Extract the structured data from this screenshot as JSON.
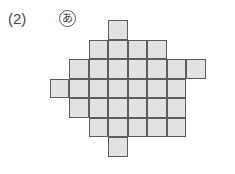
{
  "figure": {
    "label": "(2)",
    "marker": {
      "name": "circled-hiragana-a",
      "glyph": "あ"
    },
    "background_color": "#ffffff",
    "cell_fill_color": "#e2e2e2",
    "cell_stroke_color": "#5d5d5d",
    "label_color": "#4a4a4a"
  },
  "grid": {
    "origin_x": 30,
    "origin_y": 20,
    "cell_size": 19.5,
    "columns": 9,
    "rows": 7,
    "rows_description": [
      {
        "row": 0,
        "cols": [
          4
        ]
      },
      {
        "row": 1,
        "cols": [
          3,
          4,
          5,
          6
        ]
      },
      {
        "row": 2,
        "cols": [
          2,
          3,
          4,
          5,
          6,
          7,
          8
        ]
      },
      {
        "row": 3,
        "cols": [
          1,
          2,
          3,
          4,
          5,
          6,
          7
        ]
      },
      {
        "row": 4,
        "cols": [
          2,
          3,
          4,
          5,
          6,
          7
        ]
      },
      {
        "row": 5,
        "cols": [
          3,
          4,
          5,
          6,
          7
        ]
      },
      {
        "row": 6,
        "cols": [
          4
        ]
      }
    ],
    "total_cells": 30
  }
}
